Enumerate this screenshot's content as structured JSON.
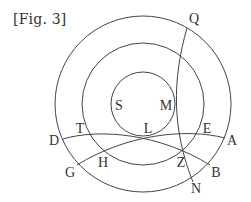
{
  "figure": {
    "caption": "[Fig. 3]",
    "stroke_color": "#444444",
    "text_color": "#333333",
    "circles": [
      {
        "name": "outer",
        "cx": 143,
        "cy": 104,
        "r": 88
      },
      {
        "name": "middle",
        "cx": 143,
        "cy": 104,
        "r": 61
      },
      {
        "name": "inner",
        "cx": 143,
        "cy": 104,
        "r": 32
      }
    ],
    "curves": [
      {
        "name": "arc-D-T-L-Z-B",
        "path": "M63,139 C 100,128 160,134 210,165"
      },
      {
        "name": "arc-G-H-L-E-A",
        "path": "M77,165 C 127,134 187,128 225,138"
      },
      {
        "name": "arc-Q-M-Z-N",
        "path": "M187,28 C 172,80 172,130 193,182"
      }
    ],
    "labels": {
      "Q": "Q",
      "S": "S",
      "M": "M",
      "T": "T",
      "L": "L",
      "E": "E",
      "D": "D",
      "A": "A",
      "H": "H",
      "Z": "Z",
      "G": "G",
      "B": "B",
      "N": "N"
    }
  }
}
